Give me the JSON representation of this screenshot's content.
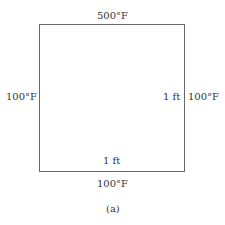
{
  "diagram": {
    "edges": {
      "top": "500°F",
      "left": "100°F",
      "right": "100°F",
      "bottom": "100°F"
    },
    "dimensions": {
      "width": "1 ft",
      "height": "1 ft"
    },
    "caption": "(a)"
  }
}
